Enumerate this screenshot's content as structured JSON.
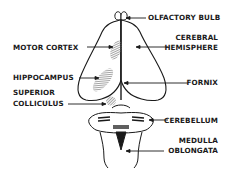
{
  "diagram": {
    "title": "",
    "colors": {
      "line": "#1a1a1a",
      "shade": "#8a8a8a",
      "background": "#ffffff"
    },
    "labels": {
      "olfactory_bulb": "OLFACTORY BULB",
      "cerebral_hemisphere_1": "CEREBRAL",
      "cerebral_hemisphere_2": "HEMISPHERE",
      "motor_cortex": "MOTOR CORTEX",
      "hippocampus": "HIPPOCAMPUS",
      "fornix": "FORNIX",
      "superior_colliculus_1": "SUPERIOR",
      "superior_colliculus_2": "COLLICULUS",
      "cerebellum": "CEREBELLUM",
      "medulla_oblongata_1": "MEDULLA",
      "medulla_oblongata_2": "OBLONGATA"
    }
  }
}
